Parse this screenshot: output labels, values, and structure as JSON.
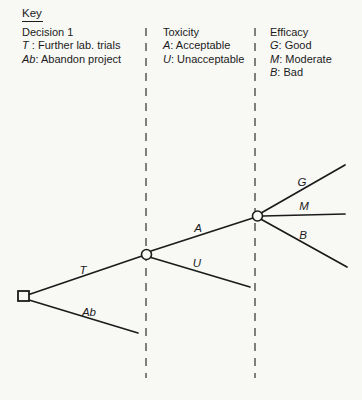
{
  "page": {
    "bg": "#f8f8f5",
    "ink": "#1b1b1b",
    "divider_color": "#3d3d3d"
  },
  "key": {
    "heading": "Key",
    "columns": [
      {
        "title": "Decision 1",
        "entries": [
          {
            "symbol": "T",
            "sep": " : ",
            "text": "Further lab. trials"
          },
          {
            "symbol": "Ab",
            "sep": ": ",
            "text": "Abandon project"
          }
        ]
      },
      {
        "title": "Toxicity",
        "entries": [
          {
            "symbol": "A",
            "sep": ": ",
            "text": "Acceptable"
          },
          {
            "symbol": "U",
            "sep": ": ",
            "text": "Unacceptable"
          }
        ]
      },
      {
        "title": "Efficacy",
        "entries": [
          {
            "symbol": "G",
            "sep": ": ",
            "text": "Good"
          },
          {
            "symbol": "M",
            "sep": ": ",
            "text": "Moderate"
          },
          {
            "symbol": "B",
            "sep": ": ",
            "text": "Bad"
          }
        ]
      }
    ]
  },
  "tree": {
    "dividers": [
      {
        "x": 146,
        "y1": 28,
        "y2": 378
      },
      {
        "x": 255,
        "y1": 28,
        "y2": 378
      }
    ],
    "decision_node": {
      "x": 18,
      "y": 291,
      "w": 11,
      "h": 10
    },
    "chance_nodes": [
      {
        "cx": 146.5,
        "cy": 254.5,
        "r": 5
      },
      {
        "cx": 257.5,
        "cy": 216,
        "r": 5
      }
    ],
    "branches": [
      {
        "id": "T",
        "x1": 29,
        "y1": 294.5,
        "x2": 142,
        "y2": 256,
        "label": "T",
        "lx": 83,
        "ly": 274
      },
      {
        "id": "Ab",
        "x1": 29,
        "y1": 300,
        "x2": 138,
        "y2": 333,
        "label": "Ab",
        "lx": 89,
        "ly": 316
      },
      {
        "id": "A",
        "x1": 151,
        "y1": 251,
        "x2": 253,
        "y2": 218,
        "label": "A",
        "lx": 198,
        "ly": 231.5
      },
      {
        "id": "U",
        "x1": 151,
        "y1": 257.5,
        "x2": 250,
        "y2": 287,
        "label": "U",
        "lx": 197,
        "ly": 267
      },
      {
        "id": "G",
        "x1": 262,
        "y1": 212.5,
        "x2": 345,
        "y2": 165,
        "label": "G",
        "lx": 302,
        "ly": 186
      },
      {
        "id": "M",
        "x1": 263,
        "y1": 216,
        "x2": 345,
        "y2": 214,
        "label": "M",
        "lx": 304,
        "ly": 210
      },
      {
        "id": "B",
        "x1": 261.5,
        "y1": 219.5,
        "x2": 347,
        "y2": 267,
        "label": "B",
        "lx": 303,
        "ly": 239
      }
    ]
  }
}
